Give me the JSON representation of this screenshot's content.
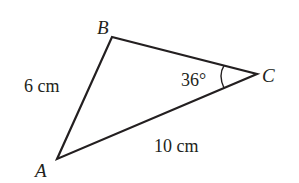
{
  "diagram": {
    "type": "triangle",
    "vertices": [
      {
        "label": "A",
        "x": 57,
        "y": 159
      },
      {
        "label": "B",
        "x": 112,
        "y": 37
      },
      {
        "label": "C",
        "x": 257,
        "y": 74
      }
    ],
    "sides": {
      "AB": "6 cm",
      "AC": "10 cm"
    },
    "angles": {
      "C": "36°"
    },
    "stroke_color": "#231f20"
  }
}
